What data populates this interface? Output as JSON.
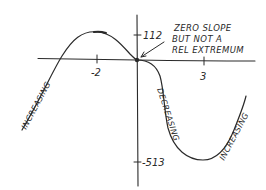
{
  "diagram": {
    "type": "function-sketch",
    "axes": {
      "x_ticks": [
        {
          "label": "-2",
          "value": -2
        },
        {
          "label": "3",
          "value": 3
        }
      ],
      "y_ticks": [
        {
          "label": "112",
          "value": 112
        },
        {
          "label": "-513",
          "value": -513
        }
      ]
    },
    "annotation": {
      "lines": [
        "ZERO SLOPE",
        "BUT NOT A",
        "REL EXTREMUM"
      ],
      "points_to": "origin"
    },
    "region_labels": [
      {
        "text": "INCREASING",
        "position": "left"
      },
      {
        "text": "DECREASING",
        "position": "middle"
      },
      {
        "text": "INCREASING",
        "position": "right"
      }
    ],
    "key_points": [
      {
        "name": "local-max",
        "x": -2,
        "y": 112
      },
      {
        "name": "inflection-zero-slope",
        "x": 0,
        "y": 0
      },
      {
        "name": "local-min",
        "x": 3,
        "y": -513
      }
    ],
    "colors": {
      "ink": "#2a2a2a",
      "background": "#ffffff"
    }
  }
}
